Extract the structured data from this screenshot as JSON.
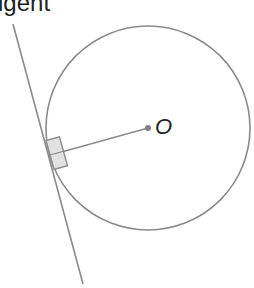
{
  "title_visible": "igent",
  "center_label": "O",
  "colors": {
    "stroke": "#8a8a8a",
    "marker_fill": "#e2e2e2",
    "text": "#222222"
  },
  "geometry": {
    "circle": {
      "cx": 148,
      "cy": 128,
      "r": 102
    },
    "center_point": {
      "x": 148,
      "y": 128
    },
    "tangent_line": {
      "x1": 13,
      "y1": 24,
      "x2": 83,
      "y2": 284
    },
    "radius_segment": {
      "x1": 148,
      "y1": 128,
      "x2": 50,
      "y2": 155
    }
  }
}
